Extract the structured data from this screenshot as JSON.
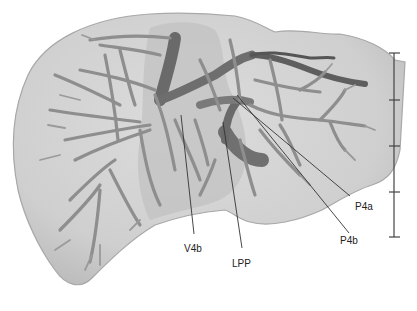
{
  "figure": {
    "colors": {
      "background": "#ffffff",
      "liver_surface": "#d2d2d2",
      "liver_edge": "#a8a8a8",
      "caudate_overlay": "#bdbdbd",
      "vessel_light": "#8c8c8c",
      "vessel_dark": "#5a5a5a",
      "leader_line": "#333333",
      "scale_bar": "#444444"
    }
  },
  "labels": [
    {
      "id": "V4b",
      "text": "V4b"
    },
    {
      "id": "LPP",
      "text": "LPP"
    },
    {
      "id": "P4b",
      "text": "P4b"
    },
    {
      "id": "P4a",
      "text": "P4a"
    }
  ],
  "scale_bar": {
    "segments": 4,
    "ticks": 5
  }
}
